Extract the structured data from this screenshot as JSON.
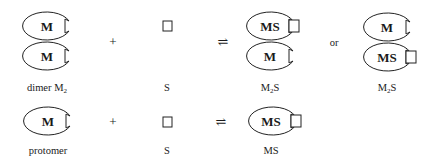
{
  "row1": {
    "reactant1": {
      "top": "M",
      "bottom": "M",
      "label": "dimer M",
      "label_sub": "2"
    },
    "plus": "+",
    "reactant2": {
      "label": "S"
    },
    "equilibrium": "⇌",
    "product1": {
      "top": "MS",
      "bottom": "M",
      "label": "M",
      "label_sub": "2",
      "label_tail": "S"
    },
    "or": "or",
    "product2": {
      "top": "M",
      "bottom": "MS",
      "label": "M",
      "label_sub": "2",
      "label_tail": "S"
    }
  },
  "row2": {
    "reactant1": {
      "inner": "M",
      "label": "protomer"
    },
    "plus": "+",
    "reactant2": {
      "label": "S"
    },
    "equilibrium": "⇌",
    "product": {
      "inner": "MS",
      "label": "MS"
    }
  }
}
